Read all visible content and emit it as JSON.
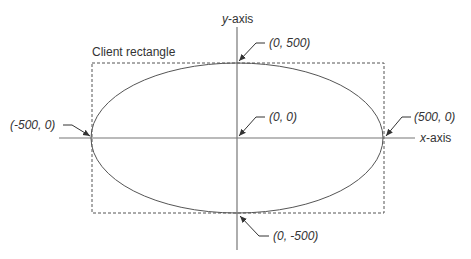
{
  "diagram": {
    "axes": {
      "x_label_var": "x",
      "x_label_suffix": "-axis",
      "y_label_var": "y",
      "y_label_suffix": "-axis"
    },
    "client_rectangle_label": "Client rectangle",
    "points": [
      {
        "id": "top",
        "label": "(0, 500)"
      },
      {
        "id": "origin",
        "label": "(0, 0)"
      },
      {
        "id": "left",
        "label": "(-500, 0)"
      },
      {
        "id": "right",
        "label": "(500, 0)"
      },
      {
        "id": "bottom",
        "label": "(0, -500)"
      }
    ],
    "colors": {
      "line": "#555555",
      "text": "#333333"
    }
  }
}
